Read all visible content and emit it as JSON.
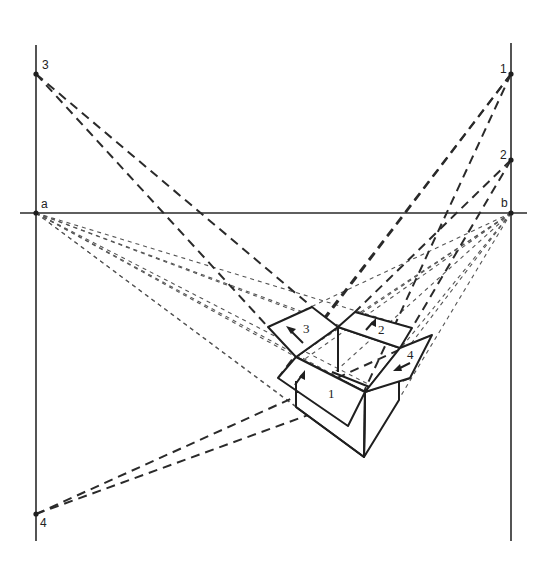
{
  "figure": {
    "horizon_line": {
      "y": 213,
      "x_start": 20,
      "x_end": 527
    },
    "vertical_left": {
      "x": 36,
      "y_start": 45,
      "y_end": 541
    },
    "vertical_right": {
      "x": 511,
      "y_start": 43,
      "y_end": 541
    },
    "vanishing_points": [
      {
        "id": "a",
        "label": "a",
        "x": 36,
        "y": 213
      },
      {
        "id": "b",
        "label": "b",
        "x": 511,
        "y": 213
      },
      {
        "id": "1",
        "label": "1",
        "x": 511,
        "y": 74
      },
      {
        "id": "2",
        "label": "2",
        "x": 511,
        "y": 160
      },
      {
        "id": "3",
        "label": "3",
        "x": 36,
        "y": 74
      },
      {
        "id": "4",
        "label": "4",
        "x": 36,
        "y": 514
      }
    ],
    "flaps": [
      {
        "id": "1",
        "label": "1"
      },
      {
        "id": "2",
        "label": "2"
      },
      {
        "id": "3",
        "label": "3"
      },
      {
        "id": "4",
        "label": "4"
      }
    ],
    "colors": {
      "ink": "#1f1f1f",
      "paper": "#ffffff",
      "construction": "#555555"
    }
  }
}
